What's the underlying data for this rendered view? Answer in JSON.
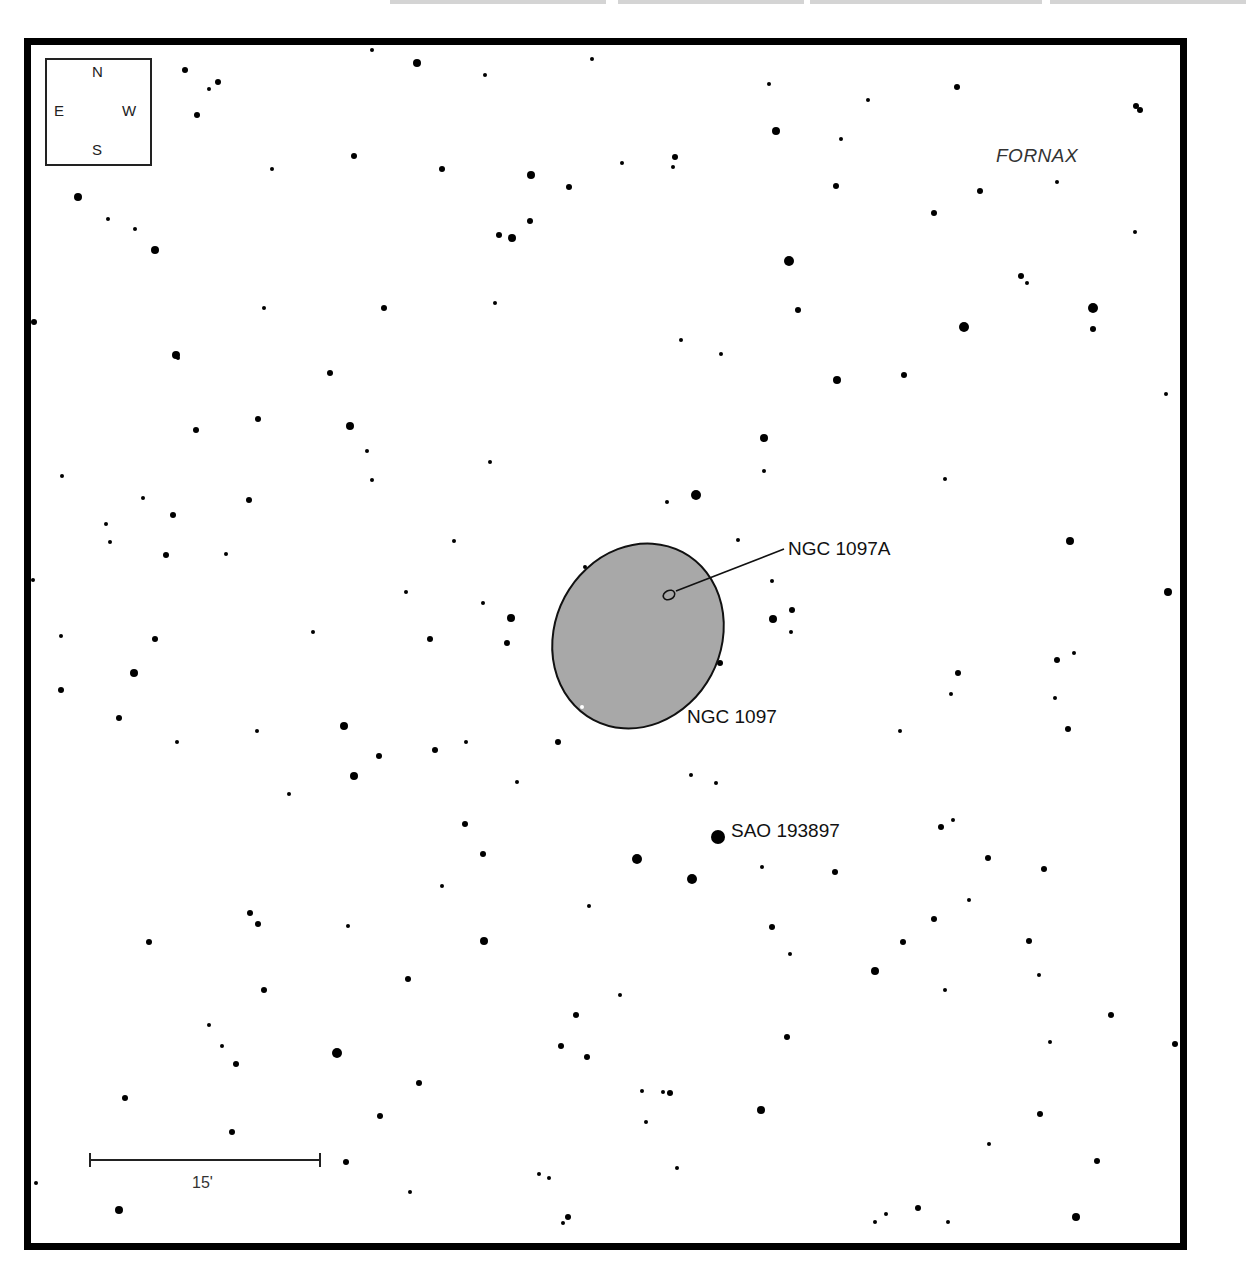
{
  "chart_title": "",
  "constellation": "FORNAX",
  "compass": {
    "north": "N",
    "south": "S",
    "east": "E",
    "west": "W"
  },
  "scale_bar": {
    "label": "15'",
    "x1": 90,
    "x2": 320,
    "y": 1160
  },
  "objects": {
    "galaxy_main": {
      "name": "NGC 1097",
      "cx": 638,
      "cy": 636,
      "rx": 83,
      "ry": 95,
      "rotation": 28,
      "fill": "#a8a8a8"
    },
    "galaxy_companion": {
      "name": "NGC 1097A",
      "cx": 668,
      "cy": 595
    },
    "bright_star": {
      "name": "SAO 193897",
      "x": 718,
      "y": 837
    }
  },
  "colors": {
    "frame": "#000000",
    "star": "#000000",
    "galaxy_fill": "#a8a8a8",
    "background": "#ffffff"
  },
  "stars": [
    [
      372,
      50,
      2
    ],
    [
      417,
      63,
      4
    ],
    [
      485,
      75,
      2
    ],
    [
      592,
      59,
      2
    ],
    [
      185,
      70,
      3
    ],
    [
      218,
      82,
      3
    ],
    [
      209,
      89,
      2
    ],
    [
      197,
      115,
      3
    ],
    [
      769,
      84,
      2
    ],
    [
      957,
      87,
      3
    ],
    [
      1136,
      106,
      3
    ],
    [
      1140,
      110,
      3
    ],
    [
      776,
      131,
      4
    ],
    [
      868,
      100,
      2
    ],
    [
      841,
      139,
      2
    ],
    [
      354,
      156,
      3
    ],
    [
      442,
      169,
      3
    ],
    [
      272,
      169,
      2
    ],
    [
      531,
      175,
      4
    ],
    [
      569,
      187,
      3
    ],
    [
      622,
      163,
      2
    ],
    [
      675,
      157,
      3
    ],
    [
      673,
      167,
      2
    ],
    [
      78,
      197,
      4
    ],
    [
      108,
      219,
      2
    ],
    [
      135,
      229,
      2
    ],
    [
      155,
      250,
      4
    ],
    [
      499,
      235,
      3
    ],
    [
      512,
      238,
      4
    ],
    [
      530,
      221,
      3
    ],
    [
      836,
      186,
      3
    ],
    [
      980,
      191,
      3
    ],
    [
      1057,
      182,
      2
    ],
    [
      934,
      213,
      3
    ],
    [
      1135,
      232,
      2
    ],
    [
      789,
      261,
      5
    ],
    [
      1021,
      276,
      3
    ],
    [
      1027,
      283,
      2
    ],
    [
      264,
      308,
      2
    ],
    [
      384,
      308,
      3
    ],
    [
      495,
      303,
      2
    ],
    [
      798,
      310,
      3
    ],
    [
      964,
      327,
      5
    ],
    [
      1093,
      308,
      5
    ],
    [
      1093,
      329,
      3
    ],
    [
      34,
      322,
      3
    ],
    [
      176,
      355,
      4
    ],
    [
      178,
      358,
      2
    ],
    [
      330,
      373,
      3
    ],
    [
      681,
      340,
      2
    ],
    [
      721,
      354,
      2
    ],
    [
      837,
      380,
      4
    ],
    [
      904,
      375,
      3
    ],
    [
      1166,
      394,
      2
    ],
    [
      196,
      430,
      3
    ],
    [
      258,
      419,
      3
    ],
    [
      350,
      426,
      4
    ],
    [
      367,
      451,
      2
    ],
    [
      372,
      480,
      2
    ],
    [
      490,
      462,
      2
    ],
    [
      764,
      438,
      4
    ],
    [
      764,
      471,
      2
    ],
    [
      945,
      479,
      2
    ],
    [
      62,
      476,
      2
    ],
    [
      143,
      498,
      2
    ],
    [
      249,
      500,
      3
    ],
    [
      173,
      515,
      3
    ],
    [
      106,
      524,
      2
    ],
    [
      110,
      542,
      2
    ],
    [
      166,
      555,
      3
    ],
    [
      226,
      554,
      2
    ],
    [
      454,
      541,
      2
    ],
    [
      667,
      502,
      2
    ],
    [
      696,
      495,
      5
    ],
    [
      738,
      540,
      2
    ],
    [
      772,
      581,
      2
    ],
    [
      1070,
      541,
      4
    ],
    [
      585,
      567,
      2
    ],
    [
      406,
      592,
      2
    ],
    [
      483,
      603,
      2
    ],
    [
      511,
      618,
      4
    ],
    [
      507,
      643,
      3
    ],
    [
      430,
      639,
      3
    ],
    [
      773,
      619,
      4
    ],
    [
      792,
      610,
      3
    ],
    [
      791,
      632,
      2
    ],
    [
      720,
      663,
      3
    ],
    [
      1168,
      592,
      4
    ],
    [
      33,
      580,
      2
    ],
    [
      313,
      632,
      2
    ],
    [
      61,
      636,
      2
    ],
    [
      155,
      639,
      3
    ],
    [
      134,
      673,
      4
    ],
    [
      61,
      690,
      3
    ],
    [
      119,
      718,
      3
    ],
    [
      958,
      673,
      3
    ],
    [
      951,
      694,
      2
    ],
    [
      1057,
      660,
      3
    ],
    [
      1074,
      653,
      2
    ],
    [
      1055,
      698,
      2
    ],
    [
      1068,
      729,
      3
    ],
    [
      177,
      742,
      2
    ],
    [
      257,
      731,
      2
    ],
    [
      344,
      726,
      4
    ],
    [
      379,
      756,
      3
    ],
    [
      354,
      776,
      4
    ],
    [
      435,
      750,
      3
    ],
    [
      466,
      742,
      2
    ],
    [
      558,
      742,
      3
    ],
    [
      900,
      731,
      2
    ],
    [
      289,
      794,
      2
    ],
    [
      517,
      782,
      2
    ],
    [
      691,
      775,
      2
    ],
    [
      716,
      783,
      2
    ],
    [
      465,
      824,
      3
    ],
    [
      483,
      854,
      3
    ],
    [
      637,
      859,
      5
    ],
    [
      692,
      879,
      5
    ],
    [
      762,
      867,
      2
    ],
    [
      835,
      872,
      3
    ],
    [
      941,
      827,
      3
    ],
    [
      953,
      820,
      2
    ],
    [
      988,
      858,
      3
    ],
    [
      1044,
      869,
      3
    ],
    [
      442,
      886,
      2
    ],
    [
      589,
      906,
      2
    ],
    [
      250,
      913,
      3
    ],
    [
      258,
      924,
      3
    ],
    [
      149,
      942,
      3
    ],
    [
      348,
      926,
      2
    ],
    [
      484,
      941,
      4
    ],
    [
      772,
      927,
      3
    ],
    [
      790,
      954,
      2
    ],
    [
      903,
      942,
      3
    ],
    [
      969,
      900,
      2
    ],
    [
      934,
      919,
      3
    ],
    [
      1029,
      941,
      3
    ],
    [
      1039,
      975,
      2
    ],
    [
      875,
      971,
      4
    ],
    [
      408,
      979,
      3
    ],
    [
      264,
      990,
      3
    ],
    [
      620,
      995,
      2
    ],
    [
      945,
      990,
      2
    ],
    [
      209,
      1025,
      2
    ],
    [
      222,
      1046,
      2
    ],
    [
      236,
      1064,
      3
    ],
    [
      337,
      1053,
      5
    ],
    [
      576,
      1015,
      3
    ],
    [
      561,
      1046,
      3
    ],
    [
      587,
      1057,
      3
    ],
    [
      787,
      1037,
      3
    ],
    [
      1111,
      1015,
      3
    ],
    [
      1050,
      1042,
      2
    ],
    [
      419,
      1083,
      3
    ],
    [
      380,
      1116,
      3
    ],
    [
      642,
      1091,
      2
    ],
    [
      663,
      1092,
      2
    ],
    [
      670,
      1093,
      3
    ],
    [
      125,
      1098,
      3
    ],
    [
      761,
      1110,
      4
    ],
    [
      646,
      1122,
      2
    ],
    [
      1040,
      1114,
      3
    ],
    [
      232,
      1132,
      3
    ],
    [
      346,
      1162,
      3
    ],
    [
      1097,
      1161,
      3
    ],
    [
      1175,
      1044,
      3
    ],
    [
      989,
      1144,
      2
    ],
    [
      677,
      1168,
      2
    ],
    [
      539,
      1174,
      2
    ],
    [
      549,
      1178,
      2
    ],
    [
      410,
      1192,
      2
    ],
    [
      36,
      1183,
      2
    ],
    [
      119,
      1210,
      4
    ],
    [
      568,
      1217,
      3
    ],
    [
      563,
      1223,
      2
    ],
    [
      886,
      1214,
      2
    ],
    [
      918,
      1208,
      3
    ],
    [
      875,
      1222,
      2
    ],
    [
      948,
      1222,
      2
    ],
    [
      1076,
      1217,
      4
    ]
  ]
}
